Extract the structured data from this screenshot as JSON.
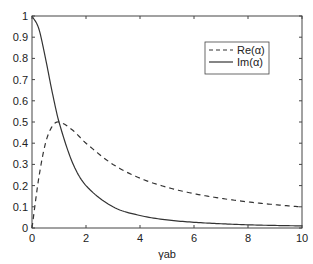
{
  "chart_data": {
    "type": "line",
    "title": "",
    "xlabel": "γab",
    "ylabel": "",
    "xlim": [
      0,
      10
    ],
    "ylim": [
      0,
      1
    ],
    "xticks": [
      0,
      2,
      4,
      6,
      8,
      10
    ],
    "yticks": [
      0,
      0.1,
      0.2,
      0.3,
      0.4,
      0.5,
      0.6,
      0.7,
      0.8,
      0.9,
      1
    ],
    "xtick_labels": [
      "0",
      "2",
      "4",
      "6",
      "8",
      "10"
    ],
    "ytick_labels": [
      "0",
      "0.1",
      "0.2",
      "0.3",
      "0.4",
      "0.5",
      "0.6",
      "0.7",
      "0.8",
      "0.9",
      "1"
    ],
    "grid": false,
    "legend_position": "upper right",
    "x": [
      0,
      0.25,
      0.5,
      0.75,
      1,
      1.5,
      2,
      3,
      4,
      5,
      6,
      7,
      8,
      9,
      10
    ],
    "series": [
      {
        "name": "Re(α)",
        "style": "dashed",
        "color": "#333333",
        "values": [
          0,
          0.235,
          0.4,
          0.48,
          0.5,
          0.462,
          0.4,
          0.3,
          0.235,
          0.192,
          0.162,
          0.14,
          0.123,
          0.11,
          0.099
        ]
      },
      {
        "name": "Im(α)",
        "style": "solid",
        "color": "#333333",
        "values": [
          1,
          0.941,
          0.8,
          0.64,
          0.5,
          0.308,
          0.2,
          0.1,
          0.059,
          0.038,
          0.027,
          0.02,
          0.015,
          0.012,
          0.0099
        ]
      }
    ]
  },
  "legend": {
    "items": [
      {
        "label": "Re(α)"
      },
      {
        "label": "Im(α)"
      }
    ]
  }
}
